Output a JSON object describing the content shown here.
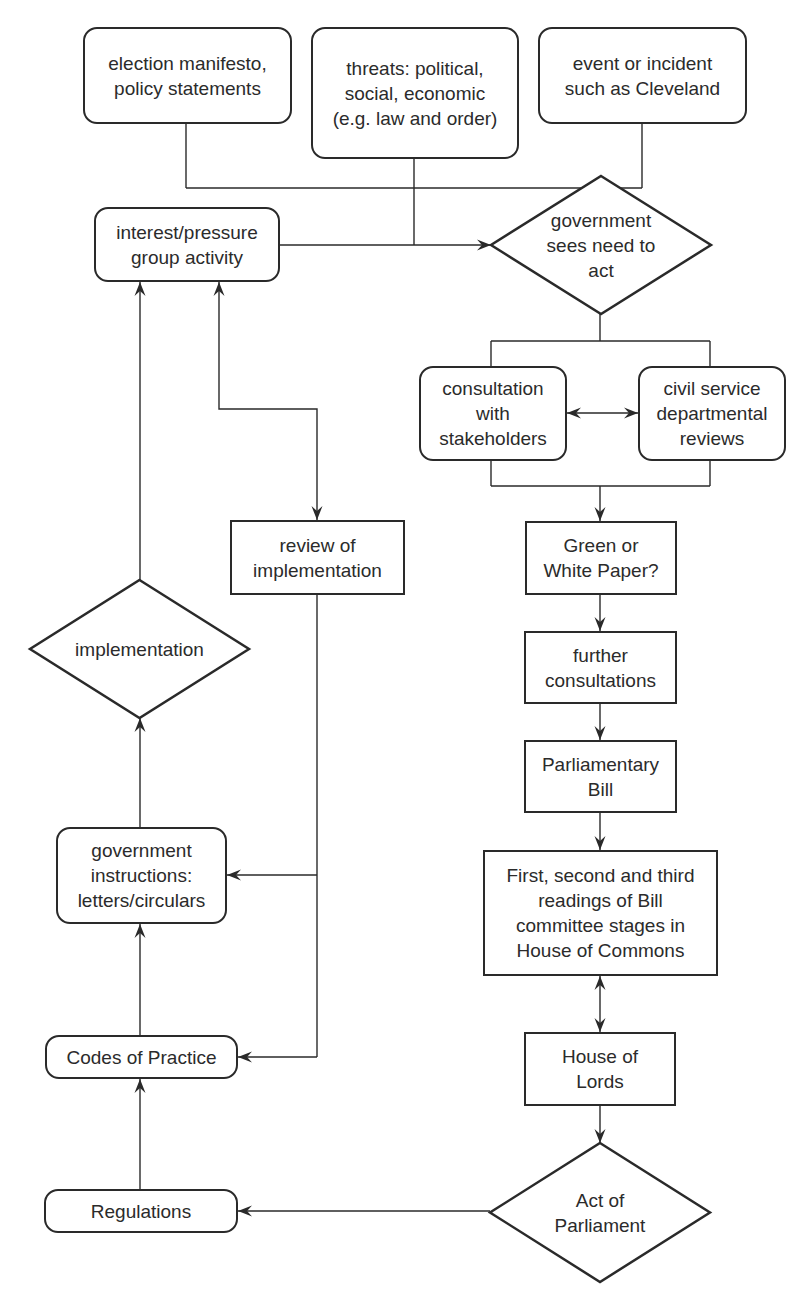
{
  "diagram": {
    "type": "flowchart",
    "stroke_color": "#2a2a2a",
    "background": "#ffffff",
    "nodes": [
      {
        "id": "election",
        "shape": "rounded",
        "label": "election manifesto,\npolicy statements",
        "x": 83,
        "y": 27,
        "w": 209,
        "h": 97
      },
      {
        "id": "threats",
        "shape": "rounded",
        "label": "threats: political,\nsocial, economic\n(e.g. law and order)",
        "x": 311,
        "y": 27,
        "w": 208,
        "h": 132
      },
      {
        "id": "event",
        "shape": "rounded",
        "label": "event or incident\nsuch as Cleveland",
        "x": 538,
        "y": 27,
        "w": 209,
        "h": 97
      },
      {
        "id": "interest",
        "shape": "rounded",
        "label": "interest/pressure\ngroup activity",
        "x": 94,
        "y": 207,
        "w": 186,
        "h": 75
      },
      {
        "id": "gov_sees",
        "shape": "diamond",
        "label": "government\nsees need to\nact",
        "x": 491,
        "y": 176,
        "w": 220,
        "h": 138
      },
      {
        "id": "consultation",
        "shape": "rounded",
        "label": "consultation\nwith\nstakeholders",
        "x": 419,
        "y": 366,
        "w": 148,
        "h": 95
      },
      {
        "id": "civil",
        "shape": "rounded",
        "label": "civil service\ndepartmental\nreviews",
        "x": 638,
        "y": 366,
        "w": 148,
        "h": 95
      },
      {
        "id": "green",
        "shape": "rect",
        "label": "Green or\nWhite Paper?",
        "x": 525,
        "y": 521,
        "w": 152,
        "h": 74
      },
      {
        "id": "further",
        "shape": "rect",
        "label": "further\nconsultations",
        "x": 524,
        "y": 631,
        "w": 153,
        "h": 73
      },
      {
        "id": "bill",
        "shape": "rect",
        "label": "Parliamentary\nBill",
        "x": 524,
        "y": 740,
        "w": 153,
        "h": 73
      },
      {
        "id": "readings",
        "shape": "rect",
        "label": "First, second and third\nreadings of Bill\ncommittee stages in\nHouse of Commons",
        "x": 483,
        "y": 850,
        "w": 235,
        "h": 126
      },
      {
        "id": "lords",
        "shape": "rect",
        "label": "House of\nLords",
        "x": 524,
        "y": 1032,
        "w": 152,
        "h": 74
      },
      {
        "id": "act",
        "shape": "diamond",
        "label": "Act of\nParliament",
        "x": 490,
        "y": 1143,
        "w": 220,
        "h": 139
      },
      {
        "id": "review",
        "shape": "rect",
        "label": "review of\nimplementation",
        "x": 230,
        "y": 520,
        "w": 175,
        "h": 75
      },
      {
        "id": "implementation",
        "shape": "diamond",
        "label": "implementation",
        "x": 30,
        "y": 580,
        "w": 219,
        "h": 138
      },
      {
        "id": "gov_instr",
        "shape": "rounded",
        "label": "government\ninstructions:\nletters/circulars",
        "x": 56,
        "y": 827,
        "w": 171,
        "h": 97
      },
      {
        "id": "codes",
        "shape": "rounded",
        "label": "Codes of Practice",
        "x": 45,
        "y": 1035,
        "w": 193,
        "h": 44
      },
      {
        "id": "regulations",
        "shape": "rounded",
        "label": "Regulations",
        "x": 44,
        "y": 1189,
        "w": 194,
        "h": 44
      }
    ],
    "lines": [
      {
        "name": "election-down",
        "points": [
          [
            186,
            124
          ],
          [
            186,
            188
          ]
        ]
      },
      {
        "name": "event-down",
        "points": [
          [
            642,
            124
          ],
          [
            642,
            188
          ]
        ]
      },
      {
        "name": "top-merge",
        "points": [
          [
            186,
            188
          ],
          [
            642,
            188
          ]
        ]
      },
      {
        "name": "threats-down",
        "points": [
          [
            414,
            159
          ],
          [
            414,
            245
          ]
        ]
      },
      {
        "name": "gov-sees-down",
        "points": [
          [
            600,
            314
          ],
          [
            600,
            341
          ]
        ]
      },
      {
        "name": "branch-line",
        "points": [
          [
            491,
            341
          ],
          [
            710,
            341
          ]
        ]
      },
      {
        "name": "branch-left",
        "points": [
          [
            491,
            341
          ],
          [
            491,
            366
          ]
        ]
      },
      {
        "name": "branch-right",
        "points": [
          [
            710,
            341
          ],
          [
            710,
            366
          ]
        ]
      },
      {
        "name": "merge-left",
        "points": [
          [
            491,
            461
          ],
          [
            491,
            486
          ]
        ]
      },
      {
        "name": "merge-right",
        "points": [
          [
            710,
            461
          ],
          [
            710,
            486
          ]
        ]
      },
      {
        "name": "merge-line",
        "points": [
          [
            491,
            486
          ],
          [
            710,
            486
          ]
        ]
      },
      {
        "name": "review-down",
        "points": [
          [
            317,
            595
          ],
          [
            317,
            1057
          ]
        ]
      }
    ],
    "arrows": [
      {
        "name": "interest-to-gov-sees",
        "points": [
          [
            280,
            245
          ],
          [
            491,
            245
          ]
        ],
        "heads": "end"
      },
      {
        "name": "consult-civil",
        "points": [
          [
            567,
            413
          ],
          [
            638,
            413
          ]
        ],
        "heads": "both"
      },
      {
        "name": "merge-to-green",
        "points": [
          [
            600,
            486
          ],
          [
            600,
            521
          ]
        ],
        "heads": "end"
      },
      {
        "name": "green-to-further",
        "points": [
          [
            600,
            595
          ],
          [
            600,
            631
          ]
        ],
        "heads": "end"
      },
      {
        "name": "further-to-bill",
        "points": [
          [
            600,
            704
          ],
          [
            600,
            740
          ]
        ],
        "heads": "end"
      },
      {
        "name": "bill-to-readings",
        "points": [
          [
            600,
            813
          ],
          [
            600,
            850
          ]
        ],
        "heads": "end"
      },
      {
        "name": "readings-lords",
        "points": [
          [
            600,
            976
          ],
          [
            600,
            1032
          ]
        ],
        "heads": "both"
      },
      {
        "name": "lords-to-act",
        "points": [
          [
            600,
            1106
          ],
          [
            600,
            1143
          ]
        ],
        "heads": "end"
      },
      {
        "name": "act-to-regulations",
        "points": [
          [
            490,
            1211
          ],
          [
            238,
            1211
          ]
        ],
        "heads": "end"
      },
      {
        "name": "regulations-to-codes",
        "points": [
          [
            140,
            1189
          ],
          [
            140,
            1079
          ]
        ],
        "heads": "end"
      },
      {
        "name": "codes-to-gov-instr",
        "points": [
          [
            140,
            1035
          ],
          [
            140,
            924
          ]
        ],
        "heads": "end"
      },
      {
        "name": "gov-instr-to-implementation",
        "points": [
          [
            140,
            827
          ],
          [
            140,
            718
          ]
        ],
        "heads": "end"
      },
      {
        "name": "implementation-to-interest",
        "points": [
          [
            140,
            580
          ],
          [
            140,
            282
          ]
        ],
        "heads": "end"
      },
      {
        "name": "interest-review",
        "points": [
          [
            219,
            282
          ],
          [
            219,
            409
          ],
          [
            317,
            409
          ],
          [
            317,
            520
          ]
        ],
        "heads": "both"
      },
      {
        "name": "review-to-gov-instr",
        "points": [
          [
            317,
            875
          ],
          [
            227,
            875
          ]
        ],
        "heads": "end"
      },
      {
        "name": "review-to-codes",
        "points": [
          [
            317,
            1057
          ],
          [
            238,
            1057
          ]
        ],
        "heads": "end"
      }
    ]
  }
}
